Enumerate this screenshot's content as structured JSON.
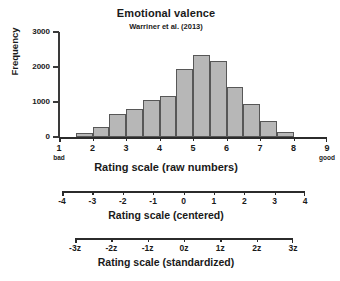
{
  "figure": {
    "title": "Emotional valence",
    "subtitle": "Warriner et al. (2013)"
  },
  "chart_data": {
    "type": "bar",
    "title": "Emotional valence",
    "subtitle": "Warriner et al. (2013)",
    "xlabel": "Rating scale (raw numbers)",
    "ylabel": "Frequency",
    "xlim": [
      1,
      9
    ],
    "ylim": [
      0,
      3000
    ],
    "grid": false,
    "legend": null,
    "bin_width": 0.5,
    "bin_centers": [
      1.75,
      2.25,
      2.75,
      3.25,
      3.75,
      4.25,
      4.75,
      5.25,
      5.75,
      6.25,
      6.75,
      7.25,
      7.75
    ],
    "bin_edges": [
      1.5,
      2.0,
      2.5,
      3.0,
      3.5,
      4.0,
      4.5,
      5.0,
      5.5,
      6.0,
      6.5,
      7.0,
      7.5,
      8.0
    ],
    "values": [
      110,
      280,
      670,
      790,
      1060,
      1180,
      1940,
      2350,
      2180,
      1430,
      950,
      450,
      150
    ],
    "yticks": [
      0,
      1000,
      2000,
      3000
    ],
    "ytick_labels": [
      "0",
      "1000",
      "2000",
      "3000"
    ],
    "xticks": [
      1,
      2,
      3,
      4,
      5,
      6,
      7,
      8,
      9
    ],
    "xtick_labels": [
      "1",
      "2",
      "3",
      "4",
      "5",
      "6",
      "7",
      "8",
      "9"
    ],
    "anchors": {
      "low": "bad",
      "high": "good"
    },
    "secondary_axes": [
      {
        "label": "Rating scale (centered)",
        "ticks": [
          -4,
          -3,
          -2,
          -1,
          0,
          1,
          2,
          3,
          4
        ],
        "tick_labels": [
          "-4",
          "-3",
          "-2",
          "-1",
          "0",
          "1",
          "2",
          "3",
          "4"
        ],
        "lim": [
          -4,
          4
        ]
      },
      {
        "label": "Rating scale (standardized)",
        "ticks": [
          -3,
          -2,
          -1,
          0,
          1,
          2,
          3
        ],
        "tick_labels": [
          "-3z",
          "-2z",
          "-1z",
          "0z",
          "1z",
          "2z",
          "3z"
        ],
        "lim": [
          -3,
          3
        ]
      }
    ],
    "colors": {
      "bar_fill": "#b7b7b7",
      "bar_edge": "#575757",
      "axis": "#2b2b2b",
      "text": "#1a1a1a",
      "background": "#ffffff"
    }
  }
}
